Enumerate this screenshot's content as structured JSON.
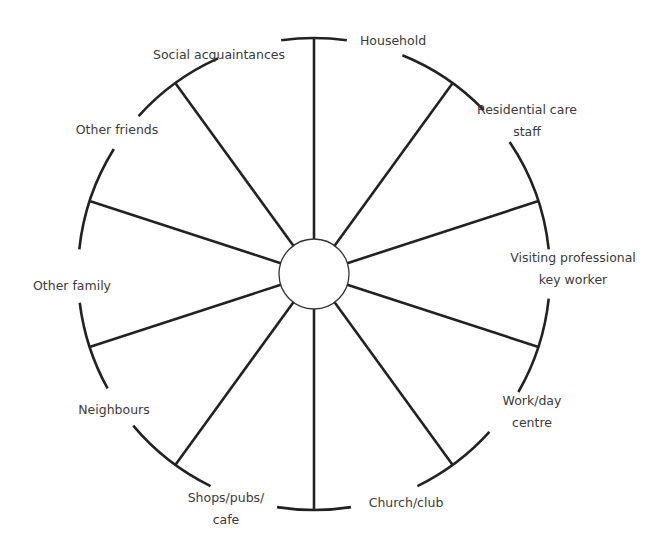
{
  "diagram": {
    "type": "ecomap-wheel",
    "center": {
      "x": 314,
      "y": 274
    },
    "outer_radius": 236,
    "inner_radius": 35,
    "stroke_color": "#222222",
    "text_color": "#3a3a3a",
    "spokes": [
      {
        "angle": -90,
        "arc": [
          -98,
          -82
        ]
      },
      {
        "angle": -54,
        "arc": [
          -68,
          -44
        ]
      },
      {
        "angle": -18,
        "arc": [
          -34,
          -6
        ]
      },
      {
        "angle": 18,
        "arc": [
          6,
          30
        ]
      },
      {
        "angle": 54,
        "arc": [
          42,
          64
        ]
      },
      {
        "angle": 90,
        "arc": [
          81,
          99
        ]
      },
      {
        "angle": 126,
        "arc": [
          116,
          140
        ]
      },
      {
        "angle": 162,
        "arc": [
          151,
          173
        ]
      },
      {
        "angle": 198,
        "arc": [
          186,
          212
        ]
      },
      {
        "angle": 234,
        "arc": [
          222,
          246
        ]
      }
    ],
    "labels": [
      {
        "id": "household",
        "lines": [
          "Household"
        ],
        "x": 393,
        "y": 41
      },
      {
        "id": "residential-care-staff",
        "lines": [
          "Residential care",
          "staff"
        ],
        "x": 527,
        "y": 121
      },
      {
        "id": "visiting-professional",
        "lines": [
          "Visiting professional",
          "key worker"
        ],
        "x": 573,
        "y": 269
      },
      {
        "id": "work-day-centre",
        "lines": [
          "Work/day",
          "centre"
        ],
        "x": 532,
        "y": 412
      },
      {
        "id": "church-club",
        "lines": [
          "Church/club"
        ],
        "x": 406,
        "y": 503
      },
      {
        "id": "shops-pubs-cafe",
        "lines": [
          "Shops/pubs/",
          "cafe"
        ],
        "x": 226,
        "y": 509
      },
      {
        "id": "neighbours",
        "lines": [
          "Neighbours"
        ],
        "x": 114,
        "y": 410
      },
      {
        "id": "other-family",
        "lines": [
          "Other family"
        ],
        "x": 72,
        "y": 286
      },
      {
        "id": "other-friends",
        "lines": [
          "Other friends"
        ],
        "x": 117,
        "y": 130
      },
      {
        "id": "social-acquaintances",
        "lines": [
          "Social acquaintances"
        ],
        "x": 219,
        "y": 55
      }
    ]
  }
}
